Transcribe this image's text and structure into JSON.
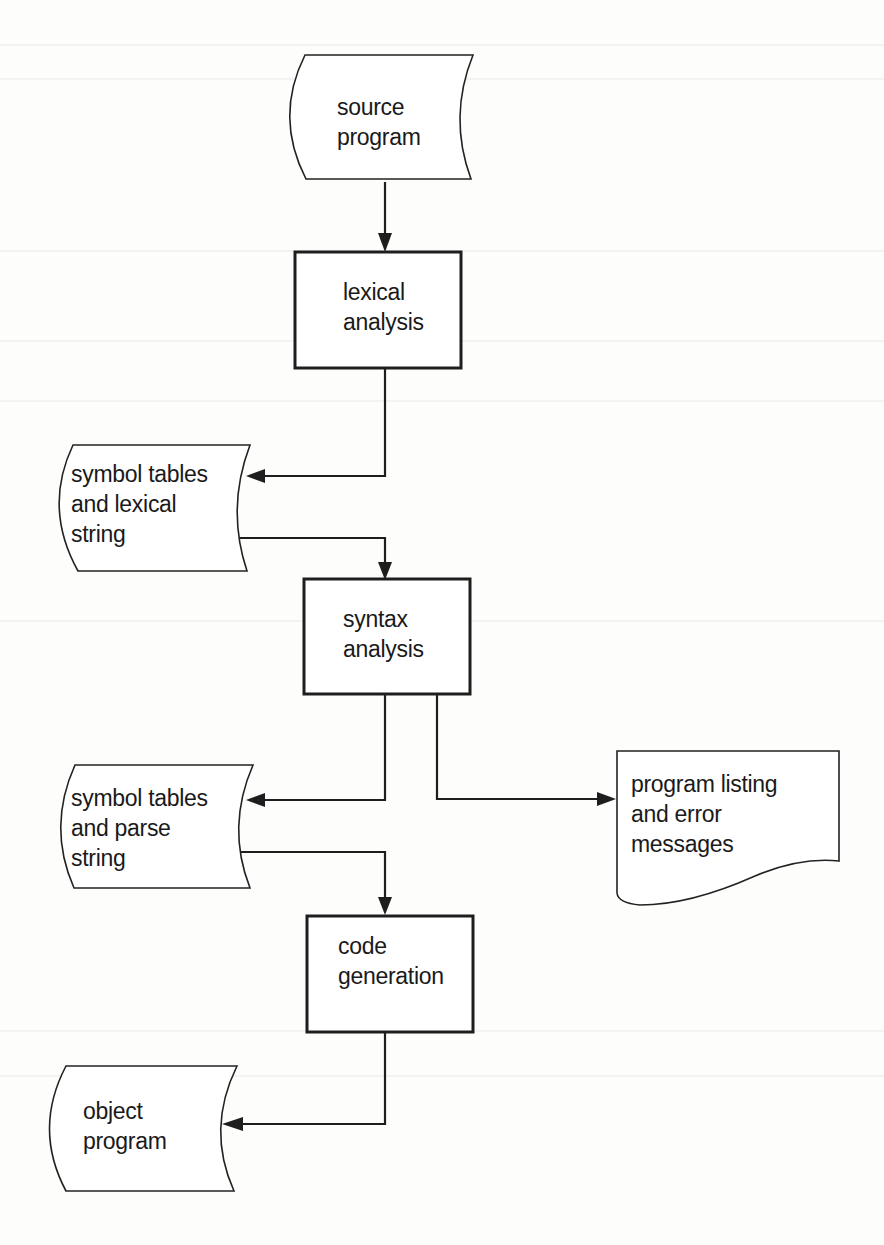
{
  "diagram": {
    "type": "flowchart",
    "nodes": [
      {
        "id": "source_program",
        "shape": "storage",
        "lines": [
          "source",
          "program"
        ]
      },
      {
        "id": "lexical_analysis",
        "shape": "process",
        "lines": [
          "lexical",
          "analysis"
        ]
      },
      {
        "id": "symbol_tables_lexical",
        "shape": "storage",
        "lines": [
          "symbol  tables",
          "and lexical",
          "string"
        ]
      },
      {
        "id": "syntax_analysis",
        "shape": "process",
        "lines": [
          "syntax",
          "analysis"
        ]
      },
      {
        "id": "symbol_tables_parse",
        "shape": "storage",
        "lines": [
          "symbol  tables",
          "and parse",
          "string"
        ]
      },
      {
        "id": "program_listing",
        "shape": "document",
        "lines": [
          "program listing",
          "and error",
          "messages"
        ]
      },
      {
        "id": "code_generation",
        "shape": "process",
        "lines": [
          "code",
          "generation"
        ]
      },
      {
        "id": "object_program",
        "shape": "storage",
        "lines": [
          "object",
          "program"
        ]
      }
    ],
    "edges": [
      {
        "from": "source_program",
        "to": "lexical_analysis"
      },
      {
        "from": "lexical_analysis",
        "to": "symbol_tables_lexical"
      },
      {
        "from": "symbol_tables_lexical",
        "to": "syntax_analysis"
      },
      {
        "from": "syntax_analysis",
        "to": "symbol_tables_parse"
      },
      {
        "from": "syntax_analysis",
        "to": "program_listing"
      },
      {
        "from": "symbol_tables_parse",
        "to": "code_generation"
      },
      {
        "from": "code_generation",
        "to": "object_program"
      }
    ]
  },
  "labels": {
    "source_program": {
      "l1": "source",
      "l2": "program"
    },
    "lexical_analysis": {
      "l1": "lexical",
      "l2": "analysis"
    },
    "symbol_tables_lexical": {
      "l1": "symbol  tables",
      "l2": "and lexical",
      "l3": "string"
    },
    "syntax_analysis": {
      "l1": "syntax",
      "l2": "analysis"
    },
    "symbol_tables_parse": {
      "l1": "symbol  tables",
      "l2": "and parse",
      "l3": "string"
    },
    "program_listing": {
      "l1": "program listing",
      "l2": "and error",
      "l3": "messages"
    },
    "code_generation": {
      "l1": "code",
      "l2": "generation"
    },
    "object_program": {
      "l1": "object",
      "l2": "program"
    }
  },
  "colors": {
    "background": "#fdfdfb",
    "stroke": "#1e1e1e",
    "text": "#1a1a1a"
  }
}
